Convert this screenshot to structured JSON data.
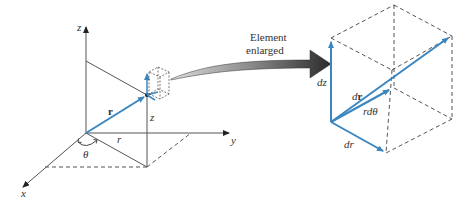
{
  "diagram": {
    "caption": {
      "line1": "Element",
      "line2": "enlarged"
    },
    "left_figure": {
      "axes": {
        "z": "z",
        "y": "y",
        "x": "x"
      },
      "position_vector": {
        "label": "r"
      },
      "height_label": "z",
      "radius_label": "r",
      "angle_label": "θ"
    },
    "right_figure": {
      "labels": {
        "dz": "dz",
        "dr_vec_d": "d",
        "dr_vec_r": "r",
        "rdtheta": "rdθ",
        "dr": "dr"
      }
    },
    "colors": {
      "vector_blue": "#3a86c0",
      "line_gray": "#555555",
      "arrow_dark": "#2b2b2b"
    }
  }
}
